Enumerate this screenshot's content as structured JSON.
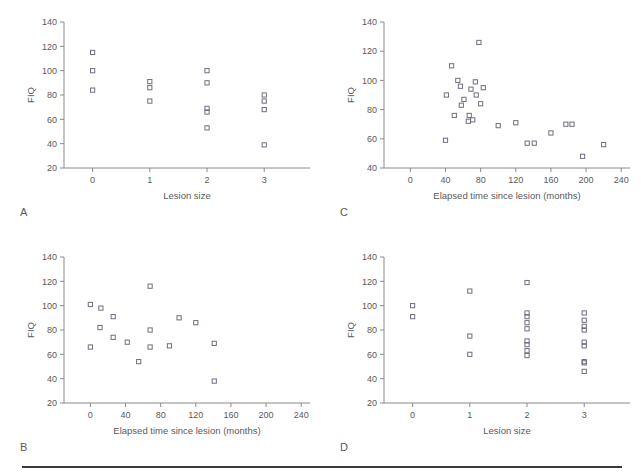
{
  "page": {
    "header_text": "",
    "background": "#ffffff",
    "marker_color": "#6e6e80",
    "axis_color": "#8a8a8a",
    "text_color": "#5a5a5a"
  },
  "chart_data": [
    {
      "id": "A",
      "type": "scatter",
      "panel_letter": "A",
      "title": "",
      "xlabel": "Lesion size",
      "ylabel": "FIQ",
      "xlim": [
        -0.5,
        3.8
      ],
      "ylim": [
        20,
        140
      ],
      "xticks": [
        0,
        1,
        2,
        3
      ],
      "yticks": [
        20,
        40,
        60,
        80,
        100,
        120,
        140
      ],
      "grid": false,
      "legend": "none",
      "points": [
        {
          "x": 0,
          "y": 115
        },
        {
          "x": 0,
          "y": 100
        },
        {
          "x": 0,
          "y": 84
        },
        {
          "x": 1,
          "y": 91
        },
        {
          "x": 1,
          "y": 86
        },
        {
          "x": 1,
          "y": 75
        },
        {
          "x": 2,
          "y": 100
        },
        {
          "x": 2,
          "y": 90
        },
        {
          "x": 2,
          "y": 69
        },
        {
          "x": 2,
          "y": 66
        },
        {
          "x": 2,
          "y": 53
        },
        {
          "x": 3,
          "y": 80
        },
        {
          "x": 3,
          "y": 75
        },
        {
          "x": 3,
          "y": 68
        },
        {
          "x": 3,
          "y": 39
        }
      ]
    },
    {
      "id": "B",
      "type": "scatter",
      "panel_letter": "B",
      "title": "",
      "xlabel": "Elapsed time since lesion (months)",
      "ylabel": "FIQ",
      "xlim": [
        -30,
        250
      ],
      "ylim": [
        20,
        140
      ],
      "xticks": [
        0,
        40,
        80,
        120,
        160,
        200,
        240
      ],
      "yticks": [
        20,
        40,
        60,
        80,
        100,
        120,
        140
      ],
      "grid": false,
      "legend": "none",
      "points": [
        {
          "x": 0,
          "y": 101
        },
        {
          "x": 0,
          "y": 66
        },
        {
          "x": 12,
          "y": 98
        },
        {
          "x": 11,
          "y": 82
        },
        {
          "x": 26,
          "y": 91
        },
        {
          "x": 26,
          "y": 74
        },
        {
          "x": 42,
          "y": 70
        },
        {
          "x": 55,
          "y": 54
        },
        {
          "x": 68,
          "y": 116
        },
        {
          "x": 68,
          "y": 80
        },
        {
          "x": 68,
          "y": 66
        },
        {
          "x": 90,
          "y": 67
        },
        {
          "x": 101,
          "y": 90
        },
        {
          "x": 120,
          "y": 86
        },
        {
          "x": 141,
          "y": 69
        },
        {
          "x": 141,
          "y": 38
        }
      ]
    },
    {
      "id": "C",
      "type": "scatter",
      "panel_letter": "C",
      "title": "",
      "xlabel": "Elapsed time since lesion (months)",
      "ylabel": "FIQ",
      "xlim": [
        -30,
        250
      ],
      "ylim": [
        40,
        140
      ],
      "xticks": [
        0,
        40,
        80,
        120,
        160,
        200,
        240
      ],
      "yticks": [
        40,
        60,
        80,
        100,
        120,
        140
      ],
      "grid": false,
      "legend": "none",
      "points": [
        {
          "x": 40,
          "y": 59
        },
        {
          "x": 41,
          "y": 90
        },
        {
          "x": 47,
          "y": 110
        },
        {
          "x": 50,
          "y": 76
        },
        {
          "x": 54,
          "y": 100
        },
        {
          "x": 57,
          "y": 96
        },
        {
          "x": 58,
          "y": 83
        },
        {
          "x": 61,
          "y": 87
        },
        {
          "x": 66,
          "y": 72
        },
        {
          "x": 67,
          "y": 76
        },
        {
          "x": 69,
          "y": 94
        },
        {
          "x": 71,
          "y": 73
        },
        {
          "x": 74,
          "y": 99
        },
        {
          "x": 75,
          "y": 90
        },
        {
          "x": 78,
          "y": 126
        },
        {
          "x": 80,
          "y": 84
        },
        {
          "x": 83,
          "y": 95
        },
        {
          "x": 100,
          "y": 69
        },
        {
          "x": 120,
          "y": 71
        },
        {
          "x": 133,
          "y": 57
        },
        {
          "x": 141,
          "y": 57
        },
        {
          "x": 160,
          "y": 64
        },
        {
          "x": 177,
          "y": 70
        },
        {
          "x": 184,
          "y": 70
        },
        {
          "x": 196,
          "y": 48
        },
        {
          "x": 220,
          "y": 56
        }
      ]
    },
    {
      "id": "D",
      "type": "scatter",
      "panel_letter": "D",
      "title": "",
      "xlabel": "Lesion size",
      "ylabel": "FIQ",
      "xlim": [
        -0.5,
        3.8
      ],
      "ylim": [
        20,
        140
      ],
      "xticks": [
        0,
        1,
        2,
        3
      ],
      "yticks": [
        20,
        40,
        60,
        80,
        100,
        120,
        140
      ],
      "grid": false,
      "legend": "none",
      "points": [
        {
          "x": 0,
          "y": 100
        },
        {
          "x": 0,
          "y": 91
        },
        {
          "x": 1,
          "y": 112
        },
        {
          "x": 1,
          "y": 75
        },
        {
          "x": 1,
          "y": 60
        },
        {
          "x": 2,
          "y": 119
        },
        {
          "x": 2,
          "y": 94
        },
        {
          "x": 2,
          "y": 91
        },
        {
          "x": 2,
          "y": 86
        },
        {
          "x": 2,
          "y": 81
        },
        {
          "x": 2,
          "y": 71
        },
        {
          "x": 2,
          "y": 68
        },
        {
          "x": 2,
          "y": 63
        },
        {
          "x": 2,
          "y": 59
        },
        {
          "x": 3,
          "y": 94
        },
        {
          "x": 3,
          "y": 88
        },
        {
          "x": 3,
          "y": 83
        },
        {
          "x": 3,
          "y": 80
        },
        {
          "x": 3,
          "y": 70
        },
        {
          "x": 3,
          "y": 67
        },
        {
          "x": 3,
          "y": 54
        },
        {
          "x": 3,
          "y": 53
        },
        {
          "x": 3,
          "y": 46
        }
      ]
    }
  ]
}
